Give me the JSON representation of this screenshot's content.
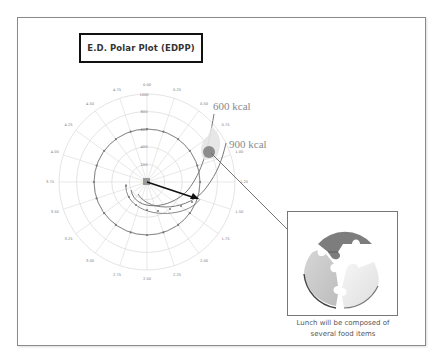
{
  "title": "E.D. Polar Plot (EDPP)",
  "chart_data": {
    "type": "polar-spiral",
    "title": "E.D. Polar Plot (EDPP)",
    "radial_ticks": [
      "0",
      "200",
      "400",
      "600",
      "800",
      "1000"
    ],
    "radial_range": [
      0,
      1000
    ],
    "angular_ticks": [
      "0.00",
      "0.25",
      "0.50",
      "0.75",
      "1.00",
      "1.25",
      "1.50",
      "1.75",
      "2.00",
      "2.25",
      "2.50",
      "2.75",
      "3.00",
      "3.25",
      "3.50",
      "3.75",
      "4.00",
      "4.25",
      "4.50",
      "4.75"
    ],
    "grid": true,
    "series": [
      {
        "name": "ring-600",
        "description": "circular series at radius ~600 with markers"
      },
      {
        "name": "600 kcal",
        "description": "spiral curve ending upper right"
      },
      {
        "name": "900 kcal",
        "description": "spiral curve ending upper right, outer"
      }
    ],
    "annotations": [
      {
        "text": "600 kcal"
      },
      {
        "text": "900 kcal"
      },
      {
        "text": "arrow from origin to ~1.50 position"
      },
      {
        "text": "highlighted point near 0.90 leading to detail panel"
      }
    ]
  },
  "labels": {
    "kcal_600": "600 kcal",
    "kcal_900": "900 kcal"
  },
  "panel": {
    "caption_line1": "Lunch will be composed of",
    "caption_line2": "several food items",
    "image_desc": "puzzle-pie-icon"
  },
  "colors": {
    "grid": "#d9d9d9",
    "series": "#7a7a7a",
    "arrow": "#111111",
    "highlight": "#8c8c8c",
    "puzzle_dark": "#7d7d7d",
    "puzzle_mid": "#c9c9c9",
    "puzzle_light": "#ececec"
  }
}
